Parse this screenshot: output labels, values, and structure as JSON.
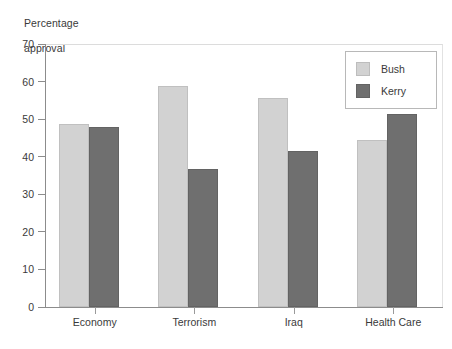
{
  "chart_data": {
    "type": "bar",
    "title": "",
    "ylabel": "Percentage\napproval",
    "xlabel": "",
    "categories": [
      "Economy",
      "Terrorism",
      "Iraq",
      "Health Care"
    ],
    "series": [
      {
        "name": "Bush",
        "color": "#d2d2d2",
        "values": [
          48.8,
          58.8,
          55.5,
          44.5
        ]
      },
      {
        "name": "Kerry",
        "color": "#6f6f6f",
        "values": [
          47.8,
          36.8,
          41.5,
          51.5
        ]
      }
    ],
    "ylim": [
      0,
      70
    ],
    "yticks": [
      0,
      10,
      20,
      30,
      40,
      50,
      60,
      70
    ],
    "ytick_labels": [
      "0",
      "10",
      "20",
      "30",
      "40",
      "50",
      "60",
      "70"
    ],
    "grid": false,
    "legend_position": "top-right",
    "legend_entries": [
      "Bush",
      "Kerry"
    ]
  },
  "axis": {
    "y_title_line1": "Percentage",
    "y_title_line2": "approval"
  },
  "legend": {
    "bush_label": "Bush",
    "kerry_label": "Kerry"
  },
  "footnote": {
    "text": ""
  }
}
